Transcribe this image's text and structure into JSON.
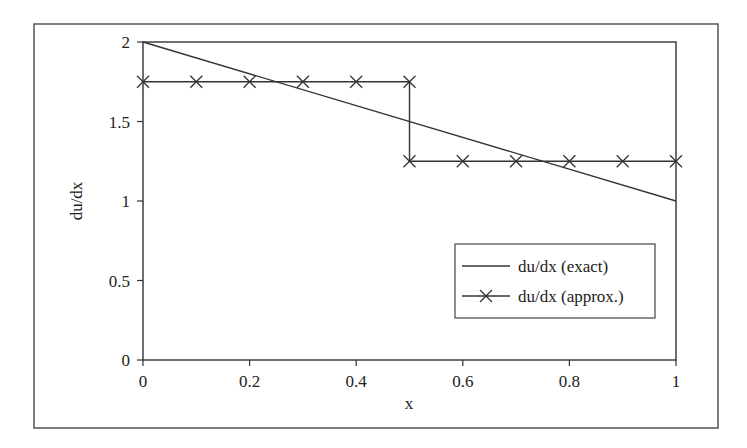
{
  "chart_data": {
    "type": "line",
    "title": "",
    "xlabel": "x",
    "ylabel": "du/dx",
    "xlim": [
      0,
      1
    ],
    "ylim": [
      0,
      2
    ],
    "x_ticks": [
      0,
      0.2,
      0.4,
      0.6,
      0.8,
      1
    ],
    "x_tick_labels": [
      "0",
      "0.2",
      "0.4",
      "0.6",
      "0.8",
      "1"
    ],
    "y_ticks": [
      0,
      0.5,
      1,
      1.5,
      2
    ],
    "y_tick_labels": [
      "0",
      "0.5",
      "1",
      "1.5",
      "2"
    ],
    "grid": false,
    "legend_position": "lower right (inside plot)",
    "series": [
      {
        "name": "du/dx (exact)",
        "style": "solid line, no markers",
        "x": [
          0,
          1
        ],
        "y": [
          2,
          1
        ]
      },
      {
        "name": "du/dx (approx.)",
        "style": "line with x markers (step)",
        "x": [
          0,
          0.1,
          0.2,
          0.3,
          0.4,
          0.5,
          0.5,
          0.6,
          0.7,
          0.8,
          0.9,
          1.0
        ],
        "y": [
          1.75,
          1.75,
          1.75,
          1.75,
          1.75,
          1.75,
          1.25,
          1.25,
          1.25,
          1.25,
          1.25,
          1.25
        ]
      }
    ]
  },
  "colors": {
    "line": "#333333",
    "frame": "#555555",
    "background": "#ffffff"
  }
}
